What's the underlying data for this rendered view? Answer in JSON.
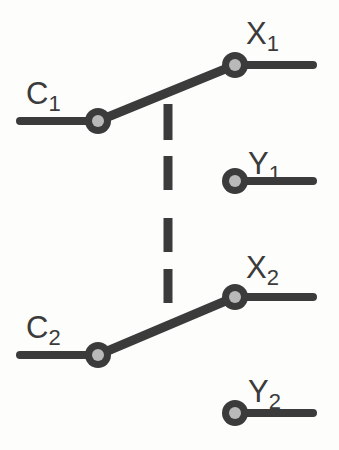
{
  "diagram": {
    "background_color": "#fdfdfc",
    "ink_color": "#3b3b3b",
    "contact_fill_color": "#b9b9b9",
    "stroke_width": 8,
    "labels": {
      "c1": {
        "base": "C",
        "sub": "1"
      },
      "x1": {
        "base": "X",
        "sub": "1"
      },
      "y1": {
        "base": "Y",
        "sub": "1"
      },
      "c2": {
        "base": "C",
        "sub": "2"
      },
      "x2": {
        "base": "X",
        "sub": "2"
      },
      "y2": {
        "base": "Y",
        "sub": "2"
      }
    },
    "terminals": [
      {
        "name": "c1",
        "cx": 98,
        "cy": 121,
        "lead_x1": 20,
        "lead_x2": 98,
        "outer_r": 13,
        "inner_r": 6
      },
      {
        "name": "x1",
        "cx": 235,
        "cy": 65,
        "lead_x1": 235,
        "lead_x2": 313,
        "outer_r": 13,
        "inner_r": 6
      },
      {
        "name": "y1",
        "cx": 235,
        "cy": 181,
        "lead_x1": 235,
        "lead_x2": 313,
        "outer_r": 13,
        "inner_r": 6
      },
      {
        "name": "c2",
        "cx": 98,
        "cy": 355,
        "lead_x1": 20,
        "lead_x2": 98,
        "outer_r": 13,
        "inner_r": 6
      },
      {
        "name": "x2",
        "cx": 235,
        "cy": 297,
        "lead_x1": 235,
        "lead_x2": 313,
        "outer_r": 13,
        "inner_r": 6
      },
      {
        "name": "y2",
        "cx": 235,
        "cy": 413,
        "lead_x1": 235,
        "lead_x2": 313,
        "outer_r": 13,
        "inner_r": 6
      }
    ],
    "blades": [
      {
        "name": "blade-1",
        "from": "c1",
        "x1": 98,
        "y1": 121,
        "x2": 235,
        "y2": 65
      },
      {
        "name": "blade-2",
        "from": "c2",
        "x1": 98,
        "y1": 355,
        "x2": 235,
        "y2": 297
      }
    ],
    "linkage": {
      "name": "mechanical-linkage",
      "x": 168,
      "dash_width": 9,
      "segments": [
        {
          "y1": 103,
          "y2": 141
        },
        {
          "y1": 155,
          "y2": 191
        },
        {
          "y1": 217,
          "y2": 253
        },
        {
          "y1": 268,
          "y2": 304
        }
      ]
    }
  }
}
